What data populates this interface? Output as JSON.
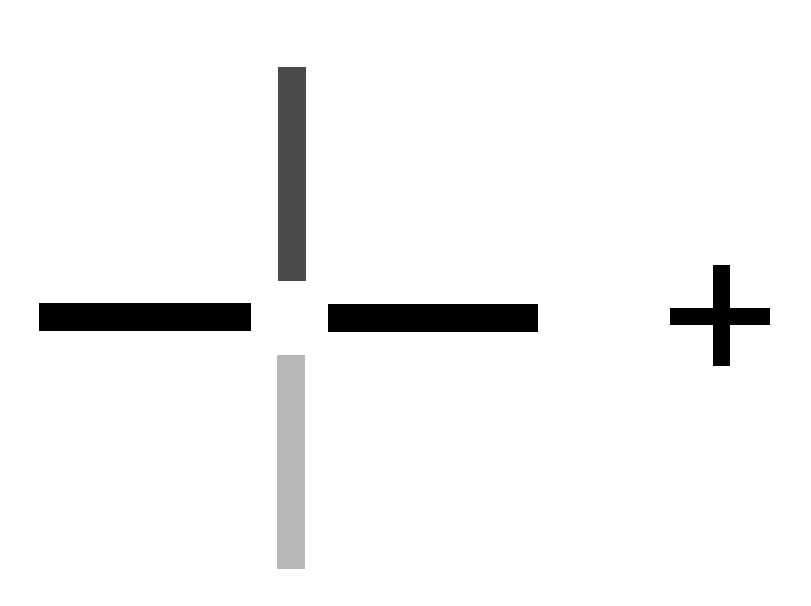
{
  "canvas": {
    "width": 811,
    "height": 606,
    "background": "#ffffff"
  },
  "stimulus": {
    "description": "Split cross with gap at center; vertical arms shaded dark (top) and light (bottom); horizontal arms black; small plus sign to the right",
    "colors": {
      "top_arm": "#4a4a4a",
      "bottom_arm": "#b8b8b8",
      "horizontal_arms": "#000000",
      "plus_sign": "#000000"
    },
    "arms": [
      {
        "name": "top-arm",
        "x": 278,
        "y": 67,
        "w": 28,
        "h": 214,
        "color": "#4a4a4a"
      },
      {
        "name": "bottom-arm",
        "x": 277,
        "y": 355,
        "w": 28,
        "h": 214,
        "color": "#b8b8b8"
      },
      {
        "name": "left-arm",
        "x": 39,
        "y": 303,
        "w": 212,
        "h": 28,
        "color": "#000000"
      },
      {
        "name": "right-arm",
        "x": 328,
        "y": 304,
        "w": 210,
        "h": 28,
        "color": "#000000"
      }
    ],
    "plus": {
      "horizontal": {
        "x": 670,
        "y": 308,
        "w": 100,
        "h": 17
      },
      "vertical": {
        "x": 713,
        "y": 265,
        "w": 17,
        "h": 101
      },
      "color": "#000000"
    }
  }
}
